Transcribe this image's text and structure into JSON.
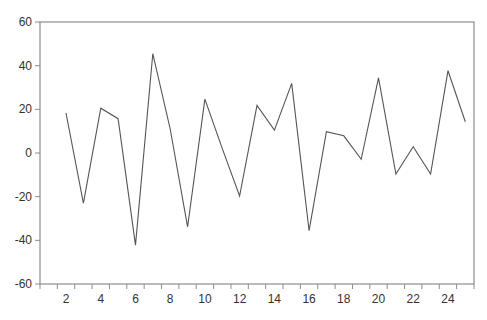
{
  "chart_data": {
    "type": "line",
    "title": "",
    "xlabel": "",
    "ylabel": "",
    "x": [
      1,
      2,
      3,
      4,
      5,
      6,
      7,
      8,
      9,
      10,
      11,
      12,
      13,
      14,
      15,
      16,
      17,
      18,
      19,
      20,
      21,
      22,
      23,
      24,
      25
    ],
    "series": [
      {
        "name": "series",
        "values": [
          null,
          18.3,
          -23,
          20.5,
          15.7,
          -42.2,
          45.5,
          11,
          -33.8,
          24.7,
          2,
          -19.7,
          21.8,
          10.5,
          31.9,
          -35.6,
          9.8,
          7.9,
          -2.9,
          34.4,
          -9.6,
          2.9,
          -9.6,
          37.7,
          14.3
        ],
        "color": "#555555"
      }
    ],
    "xlim": [
      0.5,
      25.5
    ],
    "ylim": [
      -60,
      60
    ],
    "yticks": [
      -60,
      -40,
      -20,
      0,
      20,
      40,
      60
    ],
    "xticks_labeled": [
      2,
      4,
      6,
      8,
      10,
      12,
      14,
      16,
      18,
      20,
      22,
      24
    ],
    "grid": false,
    "legend": "none",
    "colors": {
      "frame": "#8c8c8c",
      "line": "#555555",
      "text": "#333333"
    }
  }
}
